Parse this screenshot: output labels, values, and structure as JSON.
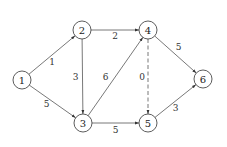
{
  "diagram": {
    "type": "directed-weighted-graph",
    "nodes": [
      {
        "id": "1",
        "label": "1",
        "x": 22,
        "y": 80
      },
      {
        "id": "2",
        "label": "2",
        "x": 82,
        "y": 30
      },
      {
        "id": "3",
        "label": "3",
        "x": 83,
        "y": 123
      },
      {
        "id": "4",
        "label": "4",
        "x": 148,
        "y": 30
      },
      {
        "id": "5",
        "label": "5",
        "x": 148,
        "y": 123
      },
      {
        "id": "6",
        "label": "6",
        "x": 203,
        "y": 79
      }
    ],
    "edges": [
      {
        "from": "1",
        "to": "2",
        "weight": "1",
        "style": "solid"
      },
      {
        "from": "1",
        "to": "3",
        "weight": "5",
        "style": "solid"
      },
      {
        "from": "2",
        "to": "4",
        "weight": "2",
        "style": "solid"
      },
      {
        "from": "2",
        "to": "3",
        "weight": "3",
        "style": "solid"
      },
      {
        "from": "3",
        "to": "4",
        "weight": "6",
        "style": "solid"
      },
      {
        "from": "3",
        "to": "5",
        "weight": "5",
        "style": "solid"
      },
      {
        "from": "4",
        "to": "5",
        "weight": "0",
        "style": "dashed"
      },
      {
        "from": "4",
        "to": "6",
        "weight": "5",
        "style": "solid"
      },
      {
        "from": "5",
        "to": "6",
        "weight": "3",
        "style": "solid"
      }
    ]
  }
}
